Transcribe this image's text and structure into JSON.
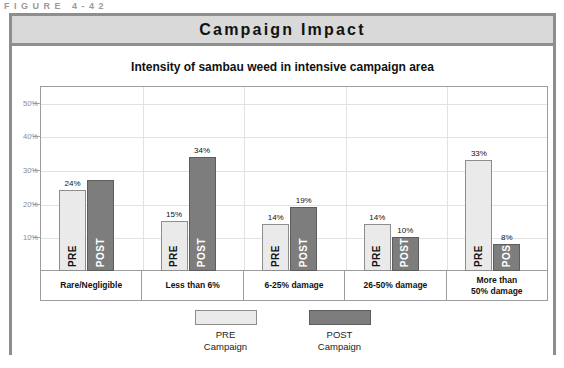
{
  "figure": {
    "caption": "FIGURE 4-42",
    "banner_title": "Campaign Impact"
  },
  "chart_data": {
    "type": "bar",
    "title": "Intensity of sambau weed in intensive campaign area",
    "subtitle": "",
    "xlabel": "",
    "ylabel": "",
    "ylim": [
      0,
      55
    ],
    "grid": true,
    "legend_position": "bottom",
    "ytick_labels": [
      "10%",
      "20%",
      "30%",
      "40%",
      "50%"
    ],
    "ytick_values": [
      10,
      20,
      30,
      40,
      50
    ],
    "categories": [
      "Rare/Negligible",
      "Less than 6%",
      "6-25% damage",
      "26-50% damage",
      "More than\n50% damage"
    ],
    "series": [
      {
        "name": "PRE Campaign",
        "short_name": "PRE",
        "color": "#eaeaea",
        "values": [
          24,
          15,
          14,
          14,
          33
        ],
        "labels": [
          "24%",
          "15%",
          "14%",
          "14%",
          "33%"
        ]
      },
      {
        "name": "POST Campaign",
        "short_name": "POST",
        "color": "#7d7d7d",
        "values": [
          27,
          34,
          19,
          10,
          8
        ],
        "labels": [
          "",
          "34%",
          "19%",
          "10%",
          "8%"
        ]
      }
    ]
  },
  "legend": {
    "items": [
      {
        "line1": "PRE",
        "line2": "Campaign",
        "swatch": "pre"
      },
      {
        "line1": "POST",
        "line2": "Campaign",
        "swatch": "post"
      }
    ]
  },
  "colors": {
    "banner_bg": "#d9d9d9",
    "frame": "#8e8e8e",
    "pre_bar": "#eaeaea",
    "post_bar": "#7d7d7d",
    "grid": "#e2e2e2"
  }
}
